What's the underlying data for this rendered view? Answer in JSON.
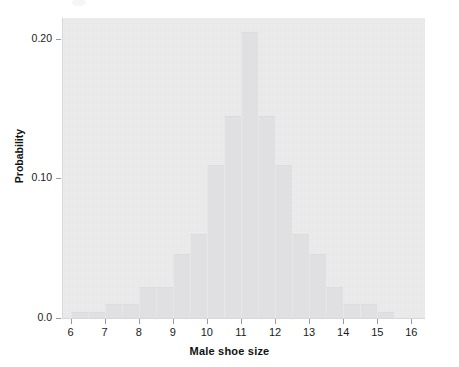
{
  "chart_data": {
    "type": "bar",
    "title": "",
    "subtitle": "",
    "xlabel": "Male shoe size",
    "ylabel": "Probability",
    "xlim": [
      5.75,
      16.4
    ],
    "ylim": [
      0.0,
      0.215
    ],
    "grid": false,
    "legend": null,
    "bin_width": 0.5,
    "x_tick_labels": [
      "6",
      "7",
      "8",
      "9",
      "10",
      "11",
      "12",
      "13",
      "14",
      "15",
      "16"
    ],
    "x_tick_values": [
      6,
      7,
      8,
      9,
      10,
      11,
      12,
      13,
      14,
      15,
      16
    ],
    "y_tick_labels": [
      "0.0",
      "0.10",
      "0.20"
    ],
    "y_tick_values": [
      0.0,
      0.1,
      0.2
    ],
    "categories": [
      6.25,
      6.75,
      7.25,
      7.75,
      8.25,
      8.75,
      9.25,
      9.75,
      10.25,
      10.75,
      11.25,
      11.75,
      12.25,
      12.75,
      13.25,
      13.75,
      14.25,
      14.75,
      15.25
    ],
    "values": [
      0.004,
      0.004,
      0.01,
      0.01,
      0.022,
      0.022,
      0.046,
      0.06,
      0.11,
      0.145,
      0.205,
      0.145,
      0.11,
      0.06,
      0.046,
      0.022,
      0.01,
      0.01,
      0.004
    ],
    "series": [
      {
        "name": "Male shoe size probability",
        "values": [
          0.004,
          0.004,
          0.01,
          0.01,
          0.022,
          0.022,
          0.046,
          0.06,
          0.11,
          0.145,
          0.205,
          0.145,
          0.11,
          0.06,
          0.046,
          0.022,
          0.01,
          0.01,
          0.004
        ]
      }
    ],
    "colors": {
      "bar_fill": "#e0e0e2",
      "panel_background": "#ececed",
      "axis": "#9a9a9c",
      "text": "#1a1a1a"
    }
  },
  "axes": {
    "x_title": "Male shoe size",
    "y_title": "Probability"
  }
}
